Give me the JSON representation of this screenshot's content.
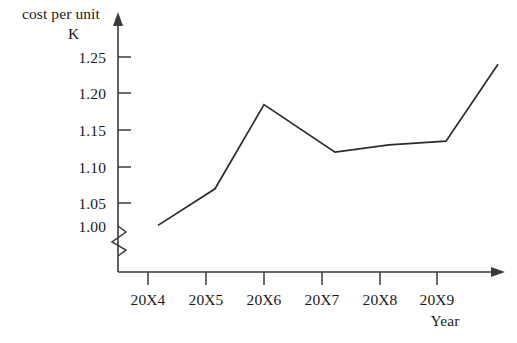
{
  "chart_data": {
    "type": "line",
    "title": "",
    "ylabel": "cost per unit K",
    "ylabel_line1": "cost per unit",
    "ylabel_line2": "K",
    "xlabel": "Year",
    "categories": [
      "20X4",
      "20X5",
      "20X6",
      "20X7",
      "20X8",
      "20X9"
    ],
    "values": [
      1.02,
      1.07,
      1.185,
      1.12,
      1.13,
      1.135
    ],
    "series": [
      {
        "name": "cost per unit",
        "values": [
          1.02,
          1.07,
          1.185,
          1.12,
          1.13,
          1.135
        ]
      }
    ],
    "line_end_value": 1.24,
    "ytick_labels": [
      "1.25",
      "1.20",
      "1.15",
      "1.10",
      "1.05",
      "1.00"
    ],
    "ytick_values": [
      1.25,
      1.2,
      1.15,
      1.1,
      1.05,
      1.0
    ],
    "ylim": [
      1.0,
      1.27
    ],
    "axis_break": true,
    "grid": false,
    "legend": false,
    "line_color": "#2b2b2b",
    "axis_color": "#3a3a3a",
    "background_color": "#ffffff"
  },
  "labels": {
    "y_axis_title_top": "cost per unit",
    "y_axis_title_unit": "K",
    "x_axis_title": "Year",
    "y_1": "1.25",
    "y_2": "1.20",
    "y_3": "1.15",
    "y_4": "1.10",
    "y_5": "1.05",
    "y_6": "1.00",
    "x_1": "20X4",
    "x_2": "20X5",
    "x_3": "20X6",
    "x_4": "20X7",
    "x_5": "20X8",
    "x_6": "20X9"
  }
}
